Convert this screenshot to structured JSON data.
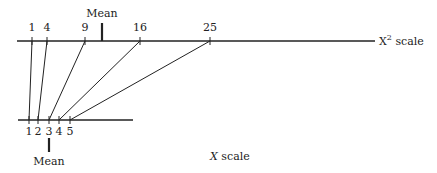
{
  "top_axis": {
    "label": "X",
    "label_sup": "2",
    "label_suffix": " scale",
    "ticks": [
      {
        "value": "1",
        "x": 32
      },
      {
        "value": "4",
        "x": 47
      },
      {
        "value": "9",
        "x": 85
      },
      {
        "value": "16",
        "x": 140
      },
      {
        "value": "25",
        "x": 210
      }
    ],
    "mean_label": "Mean",
    "mean_x": 102
  },
  "bottom_axis": {
    "label": "X",
    "label_suffix": " scale",
    "ticks": [
      {
        "value": "1",
        "x": 29
      },
      {
        "value": "2",
        "x": 38
      },
      {
        "value": "3",
        "x": 49
      },
      {
        "value": "4",
        "x": 59
      },
      {
        "value": "5",
        "x": 70
      }
    ],
    "mean_label": "Mean",
    "mean_x": 49
  },
  "mappings": [
    {
      "from": "1",
      "to": "1"
    },
    {
      "from": "2",
      "to": "4"
    },
    {
      "from": "3",
      "to": "9"
    },
    {
      "from": "4",
      "to": "16"
    },
    {
      "from": "5",
      "to": "25"
    }
  ]
}
